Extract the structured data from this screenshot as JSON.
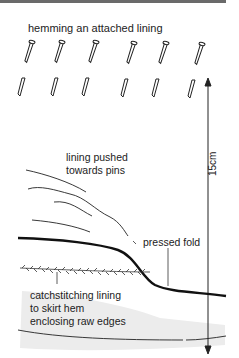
{
  "diagram": {
    "title": "hemming an attached lining",
    "labels": {
      "lining_pushed": [
        "lining pushed",
        "towards pins"
      ],
      "pressed_fold": "pressed fold",
      "catchstitching": [
        "catchstitching lining",
        "to skirt hem",
        "enclosing raw edges"
      ]
    },
    "dimension": "15cm",
    "pins": {
      "top_row_count": 6,
      "bottom_row_count": 6
    }
  }
}
